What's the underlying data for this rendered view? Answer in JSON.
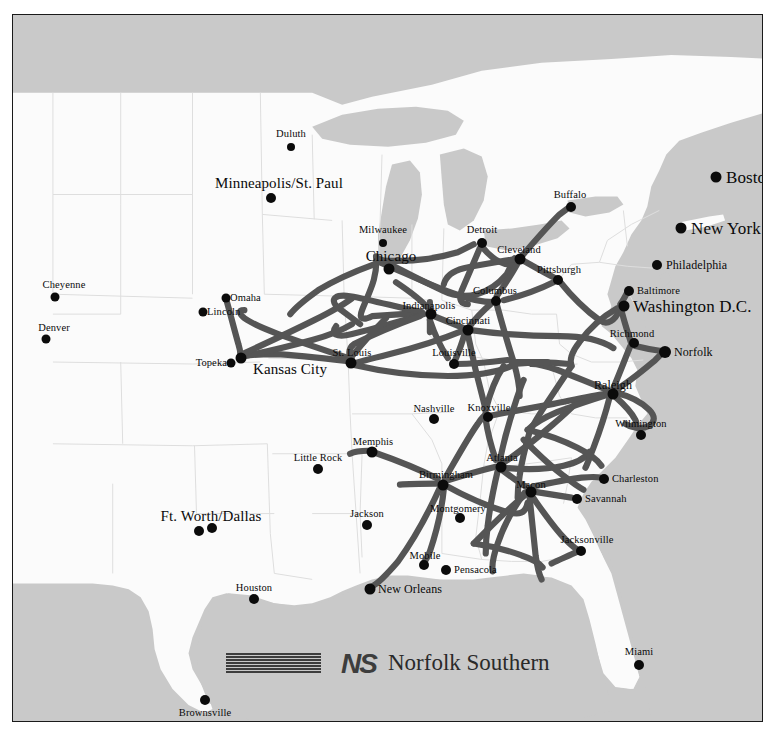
{
  "document": {
    "type": "railroad-system-map",
    "title": "Norfolk Southern System Map",
    "region": "Eastern United States"
  },
  "logo": {
    "mark_text": "NS",
    "wordmark": "Norfolk Southern",
    "stripe_count": 7,
    "mark_color": "#3d3d3d"
  },
  "colors": {
    "ocean": "#c9c9c9",
    "land": "#fbfbfb",
    "lake": "#c9c9c9",
    "rail_line": "#555555",
    "city_dot": "#0b0b0b",
    "state_border": "#dedede",
    "frame_border": "#1a1a1a",
    "label_text": "#0a0a0a"
  },
  "cities": [
    {
      "name": "Duluth",
      "x": 278,
      "y": 132,
      "dot": 4.0,
      "size": "sz-s",
      "align": "anchor-c",
      "lx": 278,
      "ly": 119,
      "served": false
    },
    {
      "name": "Minneapolis/St. Paul",
      "x": 258,
      "y": 183,
      "dot": 5.0,
      "size": "sz-l",
      "align": "anchor-c",
      "lx": 266,
      "ly": 168,
      "served": false
    },
    {
      "name": "Milwaukee",
      "x": 370,
      "y": 228,
      "dot": 4.0,
      "size": "sz-s",
      "align": "anchor-c",
      "lx": 370,
      "ly": 215,
      "served": false
    },
    {
      "name": "Chicago",
      "x": 376,
      "y": 254,
      "dot": 5.5,
      "size": "sz-l",
      "align": "anchor-c",
      "lx": 378,
      "ly": 241,
      "served": true
    },
    {
      "name": "Detroit",
      "x": 469,
      "y": 228,
      "dot": 5.0,
      "size": "sz-s",
      "align": "anchor-c",
      "lx": 469,
      "ly": 215,
      "served": true
    },
    {
      "name": "Cleveland",
      "x": 507,
      "y": 244,
      "dot": 5.5,
      "size": "sz-s",
      "align": "anchor-c",
      "lx": 506,
      "ly": 235,
      "served": true
    },
    {
      "name": "Buffalo",
      "x": 558,
      "y": 192,
      "dot": 5.0,
      "size": "sz-s",
      "align": "anchor-c",
      "lx": 557,
      "ly": 180,
      "served": true
    },
    {
      "name": "Pittsburgh",
      "x": 545,
      "y": 265,
      "dot": 5.0,
      "size": "sz-s",
      "align": "anchor-c",
      "lx": 546,
      "ly": 255,
      "served": true
    },
    {
      "name": "Columbus",
      "x": 483,
      "y": 286,
      "dot": 5.0,
      "size": "sz-s",
      "align": "anchor-c",
      "lx": 482,
      "ly": 276,
      "served": true
    },
    {
      "name": "Indianapolis",
      "x": 418,
      "y": 299,
      "dot": 5.5,
      "size": "sz-s",
      "align": "anchor-c",
      "lx": 416,
      "ly": 291,
      "served": true
    },
    {
      "name": "Cincinnati",
      "x": 455,
      "y": 315,
      "dot": 5.5,
      "size": "sz-s",
      "align": "anchor-c",
      "lx": 455,
      "ly": 306,
      "served": true
    },
    {
      "name": "Louisville",
      "x": 441,
      "y": 349,
      "dot": 5.0,
      "size": "sz-s",
      "align": "anchor-c",
      "lx": 441,
      "ly": 338,
      "served": true
    },
    {
      "name": "St. Louis",
      "x": 338,
      "y": 348,
      "dot": 5.5,
      "size": "sz-s",
      "align": "anchor-c",
      "lx": 339,
      "ly": 338,
      "served": true
    },
    {
      "name": "Kansas City",
      "x": 228,
      "y": 343,
      "dot": 5.5,
      "size": "sz-l",
      "align": "anchor-c",
      "lx": 277,
      "ly": 354,
      "served": true
    },
    {
      "name": "Topeka",
      "x": 218,
      "y": 348,
      "dot": 4.5,
      "size": "sz-s",
      "align": "anchor-r",
      "lx": 214,
      "ly": 348,
      "served": false
    },
    {
      "name": "Omaha",
      "x": 213,
      "y": 283,
      "dot": 4.5,
      "size": "sz-s",
      "align": "anchor-l",
      "lx": 217,
      "ly": 283,
      "served": false
    },
    {
      "name": "Lincoln",
      "x": 190,
      "y": 297,
      "dot": 4.5,
      "size": "sz-s",
      "align": "anchor-l",
      "lx": 194,
      "ly": 297,
      "served": false
    },
    {
      "name": "Cheyenne",
      "x": 42,
      "y": 282,
      "dot": 4.5,
      "size": "sz-s",
      "align": "anchor-c",
      "lx": 51,
      "ly": 270,
      "served": false
    },
    {
      "name": "Denver",
      "x": 33,
      "y": 324,
      "dot": 4.5,
      "size": "sz-s",
      "align": "anchor-c",
      "lx": 41,
      "ly": 313,
      "served": false
    },
    {
      "name": "Boston",
      "x": 703,
      "y": 162,
      "dot": 5.5,
      "size": "sz-xl",
      "align": "anchor-l",
      "lx": 713,
      "ly": 162,
      "served": false
    },
    {
      "name": "New York",
      "x": 668,
      "y": 213,
      "dot": 5.5,
      "size": "sz-xl",
      "align": "anchor-l",
      "lx": 678,
      "ly": 213,
      "served": false
    },
    {
      "name": "Philadelphia",
      "x": 644,
      "y": 250,
      "dot": 5.0,
      "size": "sz-m",
      "align": "anchor-l",
      "lx": 653,
      "ly": 250,
      "served": false
    },
    {
      "name": "Baltimore",
      "x": 616,
      "y": 276,
      "dot": 5.0,
      "size": "sz-s",
      "align": "anchor-l",
      "lx": 624,
      "ly": 276,
      "served": true
    },
    {
      "name": "Washington D.C.",
      "x": 611,
      "y": 291,
      "dot": 5.5,
      "size": "sz-xl",
      "align": "anchor-l",
      "lx": 620,
      "ly": 291,
      "served": true
    },
    {
      "name": "Richmond",
      "x": 621,
      "y": 328,
      "dot": 5.0,
      "size": "sz-s",
      "align": "anchor-c",
      "lx": 619,
      "ly": 319,
      "served": true
    },
    {
      "name": "Norfolk",
      "x": 652,
      "y": 337,
      "dot": 6.0,
      "size": "sz-m",
      "align": "anchor-l",
      "lx": 661,
      "ly": 337,
      "served": true
    },
    {
      "name": "Raleigh",
      "x": 600,
      "y": 379,
      "dot": 5.5,
      "size": "sz-m",
      "align": "anchor-c",
      "lx": 600,
      "ly": 370,
      "served": true
    },
    {
      "name": "Wilmington",
      "x": 628,
      "y": 420,
      "dot": 5.0,
      "size": "sz-s",
      "align": "anchor-c",
      "lx": 628,
      "ly": 409,
      "served": false
    },
    {
      "name": "Charleston",
      "x": 591,
      "y": 464,
      "dot": 5.0,
      "size": "sz-s",
      "align": "anchor-l",
      "lx": 599,
      "ly": 464,
      "served": true
    },
    {
      "name": "Savannah",
      "x": 564,
      "y": 484,
      "dot": 5.0,
      "size": "sz-s",
      "align": "anchor-l",
      "lx": 572,
      "ly": 484,
      "served": true
    },
    {
      "name": "Jacksonville",
      "x": 568,
      "y": 536,
      "dot": 5.0,
      "size": "sz-s",
      "align": "anchor-c",
      "lx": 574,
      "ly": 525,
      "served": true
    },
    {
      "name": "Miami",
      "x": 626,
      "y": 650,
      "dot": 5.0,
      "size": "sz-s",
      "align": "anchor-c",
      "lx": 626,
      "ly": 637,
      "served": false
    },
    {
      "name": "Atlanta",
      "x": 488,
      "y": 452,
      "dot": 5.5,
      "size": "sz-s",
      "align": "anchor-c",
      "lx": 489,
      "ly": 443,
      "served": true
    },
    {
      "name": "Macon",
      "x": 518,
      "y": 477,
      "dot": 5.5,
      "size": "sz-s",
      "align": "anchor-c",
      "lx": 518,
      "ly": 470,
      "served": true
    },
    {
      "name": "Birmingham",
      "x": 430,
      "y": 470,
      "dot": 5.5,
      "size": "sz-s",
      "align": "anchor-c",
      "lx": 433,
      "ly": 460,
      "served": true
    },
    {
      "name": "Montgomery",
      "x": 447,
      "y": 503,
      "dot": 5.0,
      "size": "sz-s",
      "align": "anchor-c",
      "lx": 445,
      "ly": 494,
      "served": true
    },
    {
      "name": "Mobile",
      "x": 411,
      "y": 550,
      "dot": 5.0,
      "size": "sz-s",
      "align": "anchor-c",
      "lx": 412,
      "ly": 541,
      "served": true
    },
    {
      "name": "Pensacola",
      "x": 433,
      "y": 555,
      "dot": 5.0,
      "size": "sz-s",
      "align": "anchor-l",
      "lx": 441,
      "ly": 555,
      "served": false
    },
    {
      "name": "New Orleans",
      "x": 357,
      "y": 574,
      "dot": 5.5,
      "size": "sz-m",
      "align": "anchor-l",
      "lx": 365,
      "ly": 574,
      "served": true
    },
    {
      "name": "Jackson",
      "x": 354,
      "y": 510,
      "dot": 5.0,
      "size": "sz-s",
      "align": "anchor-c",
      "lx": 354,
      "ly": 499,
      "served": false
    },
    {
      "name": "Memphis",
      "x": 359,
      "y": 437,
      "dot": 5.5,
      "size": "sz-s",
      "align": "anchor-c",
      "lx": 360,
      "ly": 427,
      "served": true
    },
    {
      "name": "Little Rock",
      "x": 305,
      "y": 454,
      "dot": 5.0,
      "size": "sz-s",
      "align": "anchor-c",
      "lx": 305,
      "ly": 443,
      "served": false
    },
    {
      "name": "Nashville",
      "x": 421,
      "y": 404,
      "dot": 5.0,
      "size": "sz-s",
      "align": "anchor-c",
      "lx": 421,
      "ly": 394,
      "served": false
    },
    {
      "name": "Knoxville",
      "x": 475,
      "y": 402,
      "dot": 5.0,
      "size": "sz-s",
      "align": "anchor-c",
      "lx": 476,
      "ly": 393,
      "served": true
    },
    {
      "name": "Ft. Worth/Dallas",
      "x": 186,
      "y": 516,
      "dot": 5.0,
      "size": "sz-l",
      "align": "anchor-c",
      "lx": 198,
      "ly": 501,
      "served": false
    },
    {
      "name": "Dallas",
      "x": 199,
      "y": 513,
      "dot": 5.0,
      "size": "sz-s",
      "align": "anchor-c",
      "lx": -999,
      "ly": -999,
      "served": false
    },
    {
      "name": "Houston",
      "x": 241,
      "y": 584,
      "dot": 5.0,
      "size": "sz-s",
      "align": "anchor-c",
      "lx": 241,
      "ly": 573,
      "served": false
    },
    {
      "name": "Brownsville",
      "x": 192,
      "y": 685,
      "dot": 5.0,
      "size": "sz-s",
      "align": "anchor-c",
      "lx": 192,
      "ly": 698,
      "served": false
    }
  ],
  "rail_lines": {
    "count": 1,
    "description": "Norfolk Southern rail network routes",
    "stroke_width": 6
  }
}
